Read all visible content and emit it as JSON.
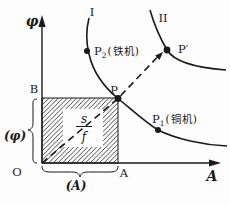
{
  "axes": {
    "y_label": "φ",
    "x_label": "A",
    "origin_label": "O"
  },
  "curves": {
    "curve1_label": "I",
    "curve2_label": "II"
  },
  "points": {
    "p2": {
      "base": "P",
      "sub": "2",
      "note": "(铁机)"
    },
    "p_prime": {
      "label": "P′"
    },
    "p": {
      "label": "P"
    },
    "p1": {
      "base": "P",
      "sub": "1",
      "note": "(铜机)"
    }
  },
  "square": {
    "top_left_label": "B",
    "bottom_right_label": "A",
    "fraction_numerator": "s",
    "fraction_denominator": "f",
    "left_brace_label": "(φ)",
    "bottom_brace_label": "(A)"
  },
  "colors": {
    "ink": "#1a1a1a",
    "background": "#fdfdfd"
  }
}
